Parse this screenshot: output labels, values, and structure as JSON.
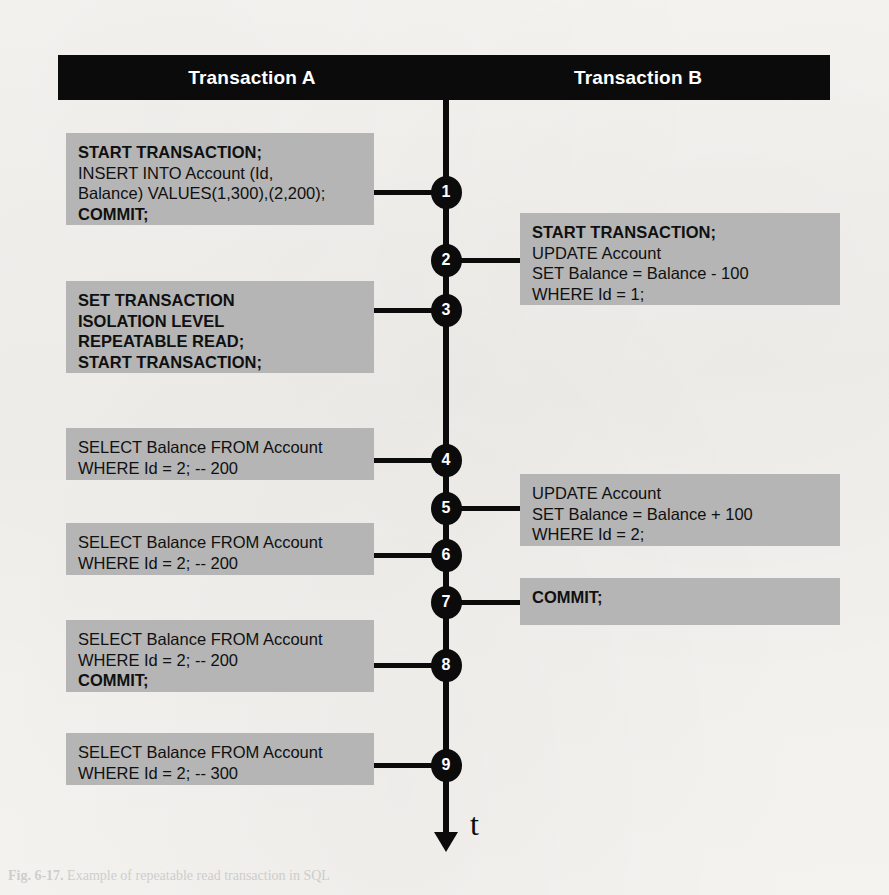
{
  "figure": {
    "axis_label": "t",
    "columns": [
      {
        "id": "transaction-a",
        "label": "Transaction A"
      },
      {
        "id": "transaction-b",
        "label": "Transaction B"
      }
    ],
    "colors": {
      "header_bg": "#0b0b0b",
      "header_text": "#ffffff",
      "box_bg": "#b5b5b5",
      "box_text": "#101010",
      "timeline": "#0b0b0b",
      "page_bg": "#f2f1ee"
    },
    "steps": [
      {
        "number": "1",
        "column": "transaction-a",
        "lines": [
          {
            "text": "START TRANSACTION;",
            "bold": true
          },
          {
            "text": "INSERT INTO Account (Id,",
            "bold": false
          },
          {
            "text": "Balance) VALUES(1,300),(2,200);",
            "bold": false
          },
          {
            "text": "COMMIT;",
            "bold": true
          }
        ]
      },
      {
        "number": "2",
        "column": "transaction-b",
        "lines": [
          {
            "text": "START TRANSACTION;",
            "bold": true
          },
          {
            "text": "UPDATE Account",
            "bold": false
          },
          {
            "text": "SET Balance = Balance - 100",
            "bold": false
          },
          {
            "text": "WHERE Id = 1;",
            "bold": false
          }
        ]
      },
      {
        "number": "3",
        "column": "transaction-a",
        "lines": [
          {
            "text": "SET TRANSACTION",
            "bold": true
          },
          {
            "text": "ISOLATION LEVEL",
            "bold": true
          },
          {
            "text": "REPEATABLE READ;",
            "bold": true
          },
          {
            "text": "START TRANSACTION;",
            "bold": true
          }
        ]
      },
      {
        "number": "4",
        "column": "transaction-a",
        "lines": [
          {
            "text": "SELECT Balance FROM Account",
            "bold": false
          },
          {
            "text": "WHERE Id = 2; -- 200",
            "bold": false
          }
        ]
      },
      {
        "number": "5",
        "column": "transaction-b",
        "lines": [
          {
            "text": "UPDATE Account",
            "bold": false
          },
          {
            "text": "SET Balance = Balance + 100",
            "bold": false
          },
          {
            "text": "WHERE Id = 2;",
            "bold": false
          }
        ]
      },
      {
        "number": "6",
        "column": "transaction-a",
        "lines": [
          {
            "text": "SELECT Balance FROM Account",
            "bold": false
          },
          {
            "text": "WHERE Id = 2; -- 200",
            "bold": false
          }
        ]
      },
      {
        "number": "7",
        "column": "transaction-b",
        "lines": [
          {
            "text": "COMMIT;",
            "bold": true
          }
        ]
      },
      {
        "number": "8",
        "column": "transaction-a",
        "lines": [
          {
            "text": "SELECT Balance FROM Account",
            "bold": false
          },
          {
            "text": "WHERE Id = 2; -- 200",
            "bold": false
          },
          {
            "text": "COMMIT;",
            "bold": true
          }
        ]
      },
      {
        "number": "9",
        "column": "transaction-a",
        "lines": [
          {
            "text": "SELECT Balance FROM Account",
            "bold": false
          },
          {
            "text": "WHERE Id = 2; -- 300",
            "bold": false
          }
        ]
      }
    ]
  },
  "caption": {
    "label": "Fig. 6-17.",
    "text": "Example of repeatable read transaction in SQL"
  }
}
